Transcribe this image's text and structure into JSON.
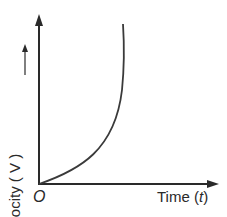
{
  "diagram": {
    "type": "velocity-time graph",
    "y_axis_label": "Velocity ( V ) —→",
    "y_axis_text": "Velocity ( V )",
    "x_axis_text": "Time (",
    "x_axis_var": "t",
    "x_axis_close": ")",
    "origin_label": "O",
    "curve": "velocity increasing at increasing rate, becoming vertical"
  }
}
